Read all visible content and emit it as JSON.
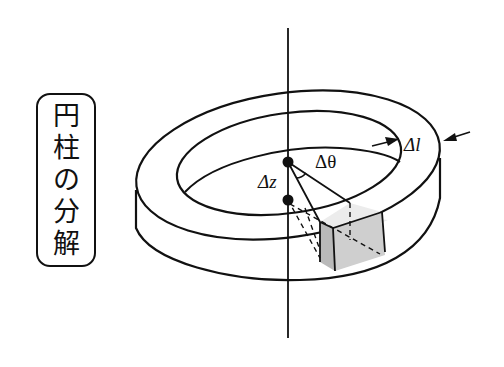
{
  "title": {
    "text": "円柱の分解",
    "chars": [
      "円",
      "柱",
      "の",
      "分",
      "解"
    ]
  },
  "diagram": {
    "labels": {
      "delta_l": "Δl",
      "delta_theta": "Δθ",
      "delta_z": "Δz"
    },
    "colors": {
      "line": "#111111",
      "box_top": "#ececec",
      "box_front": "#cfcfcf",
      "box_side": "#b9b9b9",
      "background": "#ffffff"
    }
  }
}
